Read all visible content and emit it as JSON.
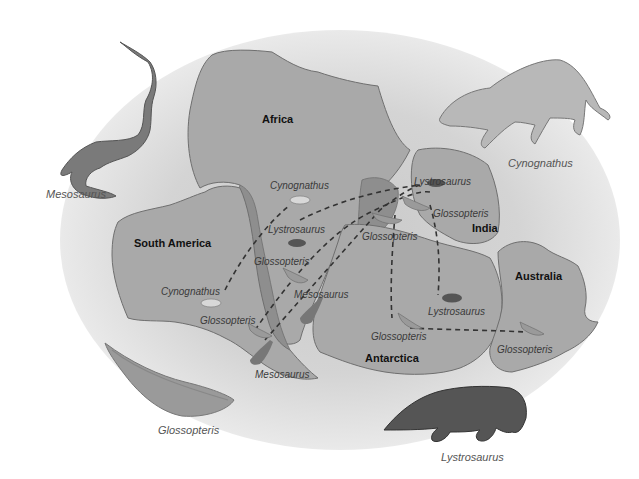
{
  "diagram": {
    "title": "",
    "colors": {
      "landmass": "#a9a9a9",
      "landmass_outline": "#6f6f6f",
      "shallow_sea": "#8e8e8e",
      "background_glow": "#cfcfcf",
      "dashed_line": "#333333",
      "mesosaurus": "#7a7a7a",
      "cynognathus": "#b8b8b8",
      "lystrosaurus": "#555555",
      "glossopteris": "#9a9a9a"
    },
    "continents": {
      "africa": "Africa",
      "south_america": "South America",
      "india": "India",
      "antarctica": "Antarctica",
      "australia": "Australia"
    },
    "map_labels": {
      "cynognathus_africa": "Cynognathus",
      "lystrosaurus_africa": "Lystrosaurus",
      "glossopteris_africa": "Glossopteris",
      "mesosaurus_africa": "Mesosaurus",
      "cynognathus_sa": "Cynognathus",
      "glossopteris_sa": "Glossopteris",
      "mesosaurus_sa": "Mesosaurus",
      "lystrosaurus_india": "Lystrosaurus",
      "glossopteris_india": "Glossopteris",
      "glossopteris_madagascar": "Glossopteris",
      "lystrosaurus_antarctica": "Lystrosaurus",
      "glossopteris_antarctica": "Glossopteris",
      "glossopteris_australia": "Glossopteris"
    },
    "legend_figures": {
      "mesosaurus": "Mesosaurus",
      "cynognathus": "Cynognathus",
      "glossopteris": "Glossopteris",
      "lystrosaurus": "Lystrosaurus"
    }
  }
}
